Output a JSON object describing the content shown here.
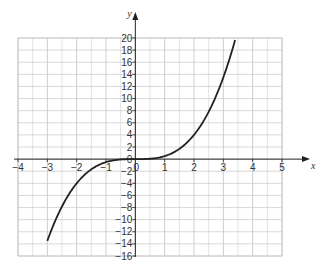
{
  "chart_data": {
    "type": "line",
    "title": "",
    "xlabel": "x",
    "ylabel": "y",
    "xlim": [
      -4,
      5
    ],
    "ylim": [
      -16,
      20
    ],
    "grid": true,
    "x_ticks": [
      -4,
      -3,
      -2,
      -1,
      0,
      1,
      2,
      3,
      4,
      5
    ],
    "x_tick_labels": [
      "-4",
      "-3",
      "-2",
      "-1",
      "0",
      "1",
      "2",
      "3",
      "4",
      "5"
    ],
    "y_ticks": [
      -16,
      -14,
      -12,
      -10,
      -8,
      -6,
      -4,
      -2,
      0,
      2,
      4,
      6,
      8,
      10,
      12,
      14,
      16,
      18,
      20
    ],
    "y_tick_labels": [
      "-16",
      "-14",
      "-12",
      "-10",
      "-8",
      "-6",
      "-4",
      "-2",
      "0",
      "2",
      "4",
      "6",
      "8",
      "10",
      "12",
      "14",
      "16",
      "18",
      "20"
    ],
    "series": [
      {
        "name": "curve",
        "function": "y = 0.5x^3",
        "x": [
          -3,
          -2.5,
          -2,
          -1.5,
          -1,
          -0.5,
          0,
          0.5,
          1,
          1.5,
          2,
          2.5,
          3,
          3.4
        ],
        "y": [
          -13.5,
          -7.8,
          -4,
          -1.7,
          -0.5,
          -0.06,
          0,
          0.06,
          0.5,
          1.7,
          4,
          7.8,
          13.5,
          19.7
        ],
        "color": "#222222"
      }
    ]
  },
  "colors": {
    "grid": "#c8c8c8",
    "axis": "#222222",
    "curve": "#222222",
    "text": "#333333"
  }
}
